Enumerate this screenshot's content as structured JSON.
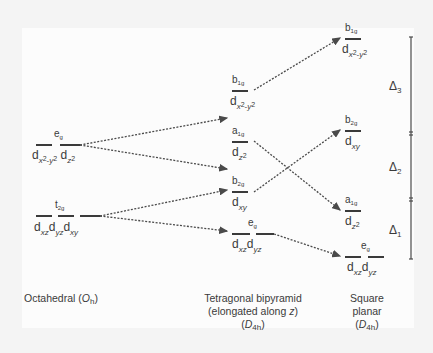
{
  "diagram": {
    "columns": [
      {
        "id": "octahedral",
        "caption_main": "Octahedral (",
        "caption_point_group": "O",
        "caption_point_group_sub": "h",
        "caption_close": ")",
        "levels": [
          {
            "id": "eg",
            "symbol": "e",
            "symbol_sub": "g",
            "orbitals": [
              "d",
              "x2-y2",
              "d",
              "z2"
            ]
          },
          {
            "id": "t2g",
            "symbol": "t",
            "symbol_sub": "2g",
            "orbitals": [
              "d",
              "xz",
              "d",
              "yz",
              "d",
              "xy"
            ]
          }
        ]
      },
      {
        "id": "tetragonal",
        "caption_line1": "Tetragonal bipyramid",
        "caption_line2_pre": "(elongated along ",
        "caption_line2_axis": "z",
        "caption_line2_post": ")",
        "caption_point_group": "D",
        "caption_point_group_sub": "4h",
        "levels": [
          {
            "id": "b1g",
            "symbol": "b",
            "symbol_sub": "1g",
            "orbital": "d",
            "orbital_sub": "x2-y2"
          },
          {
            "id": "a1g",
            "symbol": "a",
            "symbol_sub": "1g",
            "orbital": "d",
            "orbital_sub": "z2"
          },
          {
            "id": "b2g",
            "symbol": "b",
            "symbol_sub": "2g",
            "orbital": "d",
            "orbital_sub": "xy"
          },
          {
            "id": "eg",
            "symbol": "e",
            "symbol_sub": "g",
            "orbitals": [
              "d",
              "xz",
              "d",
              "yz"
            ]
          }
        ]
      },
      {
        "id": "square-planar",
        "caption_line1": "Square",
        "caption_line2": "planar",
        "caption_point_group": "D",
        "caption_point_group_sub": "4h",
        "levels": [
          {
            "id": "b1g",
            "symbol": "b",
            "symbol_sub": "1g",
            "orbital": "d",
            "orbital_sub": "x2-y2"
          },
          {
            "id": "b2g",
            "symbol": "b",
            "symbol_sub": "2g",
            "orbital": "d",
            "orbital_sub": "xy"
          },
          {
            "id": "a1g",
            "symbol": "a",
            "symbol_sub": "1g",
            "orbital": "d",
            "orbital_sub": "z2"
          },
          {
            "id": "eg",
            "symbol": "e",
            "symbol_sub": "g",
            "orbitals": [
              "d",
              "xz",
              "d",
              "yz"
            ]
          }
        ]
      }
    ],
    "energy_gaps": [
      {
        "id": "delta3",
        "label": "Δ",
        "sub": "3"
      },
      {
        "id": "delta2",
        "label": "Δ",
        "sub": "2"
      },
      {
        "id": "delta1",
        "label": "Δ",
        "sub": "1"
      }
    ],
    "colors": {
      "line": "#3a3a3a",
      "arrow": "#4a4a4a",
      "background": "#fcfcfc"
    }
  }
}
